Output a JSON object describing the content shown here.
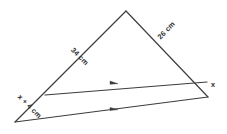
{
  "figure": {
    "type": "geometry-diagram",
    "shape": "triangle-with-parallel-segment",
    "background_color": "#ffffff",
    "line_color": "#3c3c3c",
    "text_color": "#2b2b2b"
  },
  "labels": {
    "left_side": "34 cm",
    "right_side": "26 cm",
    "lower_left_side": "x + 4 cm",
    "lower_right_side": "x"
  },
  "markers": {
    "parallel_mark_icon": "arrow-right-icon",
    "parallel_mark_count": 2
  },
  "geometry": {
    "apex": {
      "x": 126,
      "y": 11
    },
    "mid_left": {
      "x": 45,
      "y": 95
    },
    "mid_right": {
      "x": 207,
      "y": 82
    },
    "bottom_left": {
      "x": 15,
      "y": 122
    },
    "bottom_right": {
      "x": 208,
      "y": 97
    }
  }
}
